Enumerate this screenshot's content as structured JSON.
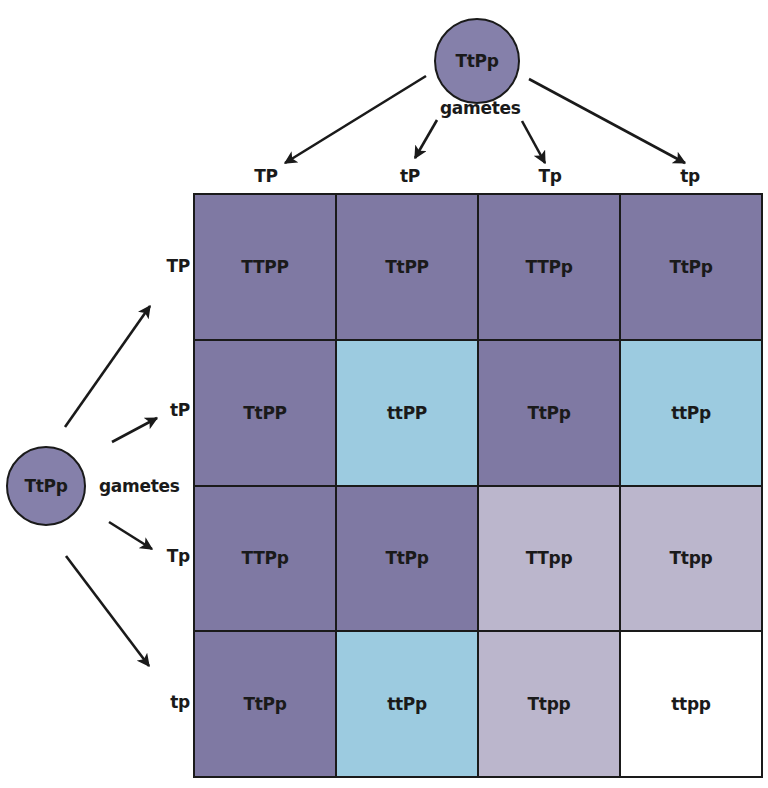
{
  "parents": {
    "top": {
      "genotype": "TtPp",
      "gametes_label": "gametes"
    },
    "left": {
      "genotype": "TtPp",
      "gametes_label": "gametes"
    }
  },
  "gametes": {
    "columns": [
      "TP",
      "tP",
      "Tp",
      "tp"
    ],
    "rows": [
      "TP",
      "tP",
      "Tp",
      "tp"
    ]
  },
  "colors": {
    "tall_purple": "#7f79a3",
    "dwarf_purple": "#9ccbe0",
    "tall_white": "#bbb6cc",
    "dwarf_white": "#ffffff",
    "outline": "#1a1a1a"
  },
  "punnett_square": {
    "cells": [
      [
        {
          "genotype": "TTPP",
          "phenotype": "tall_purple"
        },
        {
          "genotype": "TtPP",
          "phenotype": "tall_purple"
        },
        {
          "genotype": "TTPp",
          "phenotype": "tall_purple"
        },
        {
          "genotype": "TtPp",
          "phenotype": "tall_purple"
        }
      ],
      [
        {
          "genotype": "TtPP",
          "phenotype": "tall_purple"
        },
        {
          "genotype": "ttPP",
          "phenotype": "dwarf_purple"
        },
        {
          "genotype": "TtPp",
          "phenotype": "tall_purple"
        },
        {
          "genotype": "ttPp",
          "phenotype": "dwarf_purple"
        }
      ],
      [
        {
          "genotype": "TTPp",
          "phenotype": "tall_purple"
        },
        {
          "genotype": "TtPp",
          "phenotype": "tall_purple"
        },
        {
          "genotype": "TTpp",
          "phenotype": "tall_white"
        },
        {
          "genotype": "Ttpp",
          "phenotype": "tall_white"
        }
      ],
      [
        {
          "genotype": "TtPp",
          "phenotype": "tall_purple"
        },
        {
          "genotype": "ttPp",
          "phenotype": "dwarf_purple"
        },
        {
          "genotype": "Ttpp",
          "phenotype": "tall_white"
        },
        {
          "genotype": "ttpp",
          "phenotype": "dwarf_white"
        }
      ]
    ]
  }
}
